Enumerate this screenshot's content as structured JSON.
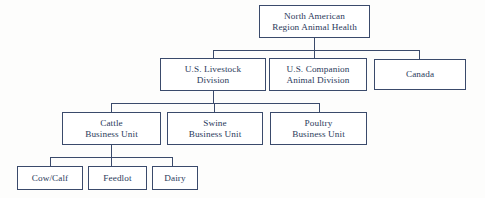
{
  "diagram": {
    "type": "org-chart",
    "colors": {
      "line": "#3a4a6b",
      "text": "#2b3a5c",
      "box_fill": "#ffffff",
      "background": "#fdfdfc"
    },
    "levels": [
      {
        "level": 1,
        "nodes": [
          {
            "id": "na-region",
            "lines": [
              "North American",
              "Region Animal Health"
            ]
          }
        ]
      },
      {
        "level": 2,
        "nodes": [
          {
            "id": "us-livestock",
            "lines": [
              "U.S. Livestock",
              "Division"
            ]
          },
          {
            "id": "us-companion",
            "lines": [
              "U.S. Companion",
              "Animal Division"
            ]
          },
          {
            "id": "canada",
            "lines": [
              "Canada"
            ]
          }
        ]
      },
      {
        "level": 3,
        "nodes": [
          {
            "id": "cattle",
            "lines": [
              "Cattle",
              "Business Unit"
            ]
          },
          {
            "id": "swine",
            "lines": [
              "Swine",
              "Business Unit"
            ]
          },
          {
            "id": "poultry",
            "lines": [
              "Poultry",
              "Business Unit"
            ]
          }
        ]
      },
      {
        "level": 4,
        "nodes": [
          {
            "id": "cow-calf",
            "lines": [
              "Cow/Calf"
            ]
          },
          {
            "id": "feedlot",
            "lines": [
              "Feedlot"
            ]
          },
          {
            "id": "dairy",
            "lines": [
              "Dairy"
            ]
          }
        ]
      }
    ]
  }
}
